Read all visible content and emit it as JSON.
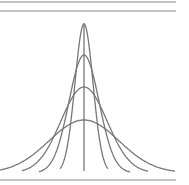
{
  "figure": {
    "line_color": "#777777",
    "border_color": "#888888",
    "center_x": 85,
    "baseline_y": 172,
    "curves": [
      {
        "name": "narrowest",
        "sigma": 9,
        "peak_y": 24
      },
      {
        "name": "narrow",
        "sigma": 15,
        "peak_y": 55
      },
      {
        "name": "medium",
        "sigma": 23,
        "peak_y": 87
      },
      {
        "name": "widest",
        "sigma": 35,
        "peak_y": 120
      }
    ]
  }
}
